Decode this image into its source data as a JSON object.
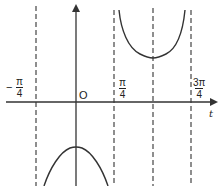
{
  "figure": {
    "type": "function-graph",
    "axes": {
      "x_label": "t",
      "origin_label": "O"
    },
    "ticks": [
      {
        "id": "neg-pi-4",
        "sign": "−",
        "numerator": "π",
        "denominator": "4"
      },
      {
        "id": "pi-4",
        "sign": "",
        "numerator": "π",
        "denominator": "4"
      },
      {
        "id": "3pi-4",
        "sign": "",
        "numerator": "3π",
        "denominator": "4"
      }
    ],
    "asymptotes": [
      "-π/4",
      "π/4",
      "3π/4"
    ],
    "symmetry_line": "π/2",
    "colors": {
      "curve": "#333333",
      "axis": "#333333",
      "dashed": "#444444",
      "background": "#ffffff"
    }
  }
}
